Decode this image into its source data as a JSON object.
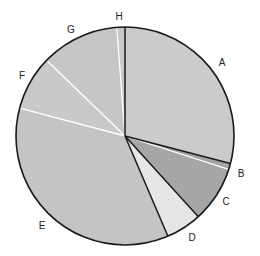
{
  "chart_data": {
    "type": "pie",
    "title": "",
    "start_angle_deg": 0,
    "direction": "clockwise",
    "categories": [
      "A",
      "B",
      "C",
      "D",
      "E",
      "F",
      "G",
      "H"
    ],
    "values": [
      29.1,
      0.9,
      8.3,
      5.3,
      35.6,
      8.1,
      11.6,
      1.2
    ],
    "unit": "%",
    "slices": [
      {
        "label": "A",
        "value": 29.1,
        "color": "#cbcbcb",
        "border": "dark",
        "label_pos": [
          222,
          66
        ]
      },
      {
        "label": "B",
        "value": 0.9,
        "color": "#a3a3a3",
        "border": "light",
        "label_pos": [
          241,
          177
        ]
      },
      {
        "label": "C",
        "value": 8.3,
        "color": "#a6a6a6",
        "border": "dark",
        "label_pos": [
          226,
          205
        ]
      },
      {
        "label": "D",
        "value": 5.3,
        "color": "#e6e6e6",
        "border": "dark",
        "label_pos": [
          192,
          241
        ]
      },
      {
        "label": "E",
        "value": 35.6,
        "color": "#c4c4c4",
        "border": "light",
        "label_pos": [
          42,
          229
        ]
      },
      {
        "label": "F",
        "value": 8.1,
        "color": "#c9c9c9",
        "border": "light",
        "label_pos": [
          22,
          79
        ]
      },
      {
        "label": "G",
        "value": 11.6,
        "color": "#c6c6c6",
        "border": "light",
        "label_pos": [
          71,
          33
        ]
      },
      {
        "label": "H",
        "value": 1.2,
        "color": "#c8c8c8",
        "border": "dark",
        "label_pos": [
          119,
          20
        ]
      }
    ],
    "legend": "none",
    "xlabel": "",
    "ylabel": ""
  },
  "layout": {
    "center": [
      125,
      136
    ],
    "radius": 109,
    "outline_color": "#1a1a1a",
    "light_divider_color": "#ffffff",
    "dark_divider_color": "#1a1a1a"
  }
}
